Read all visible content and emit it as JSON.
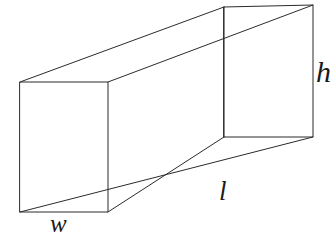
{
  "figure": {
    "kind": "rectangular-prism-diagram",
    "background_color": "#ffffff",
    "stroke_color": "#2b2b2b",
    "label_color": "#1a1a1a",
    "labels": {
      "height": "h",
      "length": "l",
      "width": "w"
    },
    "geometry": {
      "front_face": {
        "name": "front-left-rectangle",
        "points": "20,82 108,82 108,212 20,212"
      },
      "back_face": {
        "name": "back-right-rectangle",
        "points": "224,7 313,5 313,137 224,137"
      },
      "connectors": {
        "top_left_edge": "20,82 224,7",
        "top_right_edge": "108,82 313,5",
        "bottom_outer_edge": "20,212 313,137",
        "bottom_inner_edge": "108,212 224,137",
        "inner_vertical_seam": "224,7 224,137"
      }
    }
  }
}
